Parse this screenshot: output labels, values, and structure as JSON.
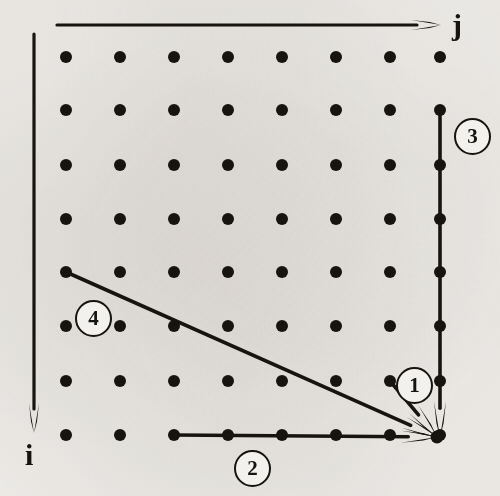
{
  "figure": {
    "background_color": "#f3f1ee",
    "ink_color": "#17140f",
    "width": 500,
    "height": 496
  },
  "axes": [
    {
      "id": "j-axis",
      "label": "j",
      "orientation": "horizontal",
      "direction": "right",
      "label_x": 452,
      "label_y": 10,
      "font_size": 30,
      "line": {
        "x1": 57,
        "y1": 25,
        "x2": 441,
        "y2": 25
      }
    },
    {
      "id": "i-axis",
      "label": "i",
      "orientation": "vertical",
      "direction": "down",
      "label_x": 25,
      "label_y": 440,
      "font_size": 30,
      "line": {
        "x1": 34,
        "y1": 34,
        "x2": 34,
        "y2": 433
      }
    }
  ],
  "grid": {
    "rows": 8,
    "cols": 8,
    "dot_radius": 6,
    "dot_color": "#17140f",
    "col_x": [
      66,
      120,
      174,
      228,
      282,
      336,
      390,
      440
    ],
    "row_y": [
      57,
      110,
      165,
      219,
      272,
      326,
      381,
      435
    ]
  },
  "arrows": [
    {
      "id": "arrow-1",
      "number": "1",
      "from": {
        "x": 390,
        "y": 381
      },
      "to": {
        "x": 437,
        "y": 437
      },
      "description": "diagonal from node one row up and one column left"
    },
    {
      "id": "arrow-2",
      "number": "2",
      "from": {
        "x": 174,
        "y": 435
      },
      "to": {
        "x": 437,
        "y": 437
      },
      "description": "horizontal along bottom row"
    },
    {
      "id": "arrow-3",
      "number": "3",
      "from": {
        "x": 440,
        "y": 110
      },
      "to": {
        "x": 440,
        "y": 437
      },
      "description": "vertical along right column"
    },
    {
      "id": "arrow-4",
      "number": "4",
      "from": {
        "x": 66,
        "y": 272
      },
      "to": {
        "x": 437,
        "y": 437
      },
      "description": "long shallow diagonal from left edge"
    }
  ],
  "callouts": [
    {
      "id": "callout-1",
      "label": "1",
      "cx": 412,
      "cy": 383
    },
    {
      "id": "callout-2",
      "label": "2",
      "cx": 250,
      "cy": 466
    },
    {
      "id": "callout-3",
      "label": "3",
      "cx": 470,
      "cy": 134
    },
    {
      "id": "callout-4",
      "label": "4",
      "cx": 91,
      "cy": 316
    }
  ]
}
